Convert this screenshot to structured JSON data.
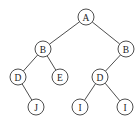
{
  "diagram": {
    "type": "binary-tree",
    "node_radius": 8,
    "nodes": [
      {
        "id": "n1",
        "label": "A",
        "x": 86,
        "y": 17
      },
      {
        "id": "n2",
        "label": "B",
        "x": 43,
        "y": 49
      },
      {
        "id": "n3",
        "label": "B",
        "x": 126,
        "y": 49
      },
      {
        "id": "n4",
        "label": "D",
        "x": 18,
        "y": 77
      },
      {
        "id": "n5",
        "label": "E",
        "x": 60,
        "y": 77
      },
      {
        "id": "n6",
        "label": "D",
        "x": 100,
        "y": 77
      },
      {
        "id": "n7",
        "label": "J",
        "x": 36,
        "y": 107
      },
      {
        "id": "n8",
        "label": "I",
        "x": 80,
        "y": 107
      },
      {
        "id": "n9",
        "label": "I",
        "x": 125,
        "y": 107
      }
    ],
    "edges": [
      {
        "from": "n1",
        "to": "n2"
      },
      {
        "from": "n1",
        "to": "n3"
      },
      {
        "from": "n2",
        "to": "n4"
      },
      {
        "from": "n2",
        "to": "n5"
      },
      {
        "from": "n3",
        "to": "n6"
      },
      {
        "from": "n4",
        "to": "n7"
      },
      {
        "from": "n6",
        "to": "n8"
      },
      {
        "from": "n6",
        "to": "n9"
      }
    ]
  }
}
